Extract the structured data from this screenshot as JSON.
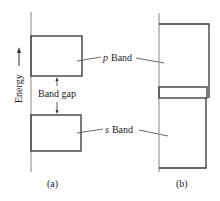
{
  "diagram": {
    "axis_label": "Energy",
    "band_gap_label": "Band gap",
    "p_band": {
      "italic": "p",
      "label": "Band"
    },
    "s_band": {
      "italic": "s",
      "label": "Band"
    },
    "captions": {
      "a": "(a)",
      "b": "(b)"
    }
  },
  "colors": {
    "line": "#333333",
    "axis": "#777777",
    "text": "#222222"
  }
}
